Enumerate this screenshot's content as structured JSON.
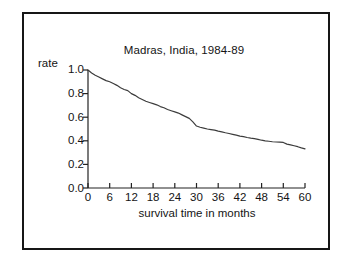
{
  "figure": {
    "frame_color": "#161616",
    "background_color": "#ffffff"
  },
  "chart_data": {
    "type": "line",
    "title": "Madras, India, 1984-89",
    "xlabel": "survival time in months",
    "ylabel": "rate",
    "xlim": [
      0,
      60
    ],
    "ylim": [
      0.0,
      1.0
    ],
    "grid": false,
    "legend": null,
    "line_color": "#3c3c3c",
    "xticks": [
      0,
      6,
      12,
      18,
      24,
      30,
      36,
      42,
      48,
      54,
      60
    ],
    "xtick_labels": [
      "0",
      "6",
      "12",
      "18",
      "24",
      "30",
      "36",
      "42",
      "48",
      "54",
      "60"
    ],
    "yticks": [
      0.0,
      0.2,
      0.4,
      0.6,
      0.8,
      1.0
    ],
    "ytick_labels": [
      "0.0",
      "0.2",
      "0.4",
      "0.6",
      "0.8",
      "1.0"
    ],
    "series": [
      {
        "name": "survival rate",
        "x": [
          0,
          1,
          2,
          3,
          4,
          5,
          6,
          7,
          8,
          9,
          10,
          11,
          12,
          13,
          14,
          15,
          16,
          17,
          18,
          19,
          20,
          21,
          22,
          23,
          24,
          25,
          26,
          27,
          28,
          29,
          30,
          31,
          32,
          33,
          34,
          35,
          36,
          37,
          38,
          39,
          40,
          41,
          42,
          43,
          44,
          45,
          46,
          47,
          48,
          49,
          50,
          51,
          52,
          53,
          54,
          55,
          56,
          57,
          58,
          59,
          60
        ],
        "values": [
          1.0,
          0.975,
          0.955,
          0.94,
          0.925,
          0.91,
          0.9,
          0.885,
          0.87,
          0.85,
          0.835,
          0.825,
          0.8,
          0.785,
          0.765,
          0.75,
          0.735,
          0.725,
          0.715,
          0.705,
          0.69,
          0.68,
          0.665,
          0.655,
          0.645,
          0.635,
          0.62,
          0.605,
          0.59,
          0.56,
          0.525,
          0.515,
          0.508,
          0.5,
          0.495,
          0.49,
          0.482,
          0.475,
          0.468,
          0.462,
          0.455,
          0.448,
          0.44,
          0.435,
          0.428,
          0.422,
          0.418,
          0.412,
          0.405,
          0.4,
          0.396,
          0.392,
          0.39,
          0.388,
          0.386,
          0.372,
          0.365,
          0.358,
          0.35,
          0.34,
          0.332
        ]
      }
    ]
  }
}
